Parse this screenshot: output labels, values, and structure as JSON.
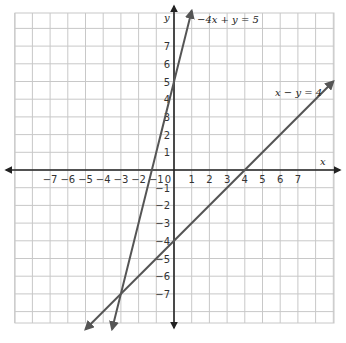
{
  "chart_data": {
    "type": "line",
    "title": "",
    "xlabel": "x",
    "ylabel": "y",
    "xlim": [
      -9,
      9
    ],
    "ylim": [
      -9,
      9
    ],
    "grid": true,
    "x_ticks": [
      -7,
      -6,
      -5,
      -4,
      -3,
      -2,
      -1,
      0,
      1,
      2,
      3,
      4,
      5,
      6,
      7
    ],
    "y_ticks": [
      -7,
      -6,
      -5,
      -4,
      -3,
      -2,
      -1,
      1,
      2,
      3,
      4,
      5,
      6,
      7
    ],
    "series": [
      {
        "name": "-4x + y = 5",
        "equation": "y = 4x + 5",
        "x": [
          -3.5,
          1
        ],
        "y": [
          -9,
          9
        ]
      },
      {
        "name": "x - y = 4",
        "equation": "y = x - 4",
        "x": [
          -5,
          9
        ],
        "y": [
          -9,
          5
        ]
      }
    ],
    "annotations": [
      {
        "text": "-4x + y = 5",
        "x": 1.3,
        "y": 8.6
      },
      {
        "text": "x - y = 4",
        "x": 5.8,
        "y": 4.3
      }
    ],
    "intersection": {
      "x": -3,
      "y": -7
    }
  },
  "labels": {
    "x_axis": "x",
    "y_axis": "y",
    "eq1": "−4x + y = 5",
    "eq2": "x − y = 4"
  },
  "colors": {
    "grid": "#c8c8c8",
    "axis": "#222222",
    "line": "#555555"
  }
}
